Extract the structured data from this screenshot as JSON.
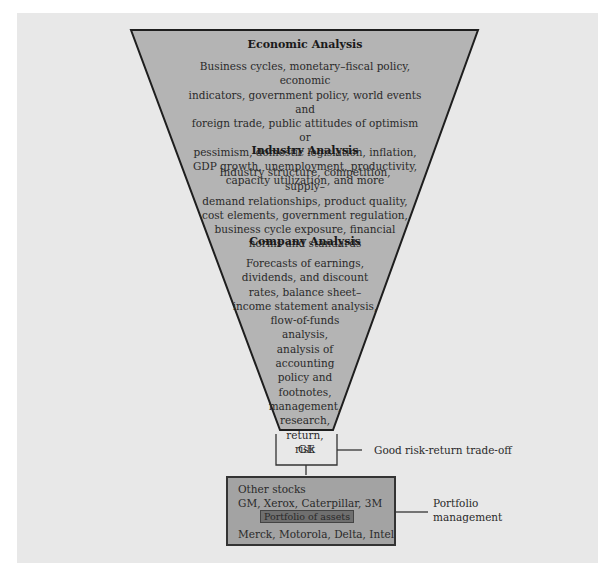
{
  "diagram": {
    "type": "funnel",
    "colors": {
      "background_panel": "#e8e8e8",
      "funnel_fill": "#b4b4b4",
      "portfolio_box_fill": "#a3a3a3",
      "assets_box_fill": "#6f6f6f",
      "stroke": "#1e1e1e"
    },
    "economic": {
      "title": "Economic Analysis",
      "lines": [
        "Business cycles, monetary–fiscal policy, economic",
        "indicators, government policy, world events and",
        "foreign trade, public attitudes of optimism or",
        "pessimism, domestic legislation, inflation,",
        "GDP growth, unemployment, productivity,",
        "capacity utilization, and more"
      ]
    },
    "industry": {
      "title": "Industry Analysis",
      "lines": [
        "Industry structure, competition, supply–",
        "demand relationships, product quality,",
        "cost elements, government regulation,",
        "business cycle exposure, financial",
        "norms and standards"
      ]
    },
    "company": {
      "title": "Company Analysis",
      "lines": [
        "Forecasts of earnings,",
        "dividends, and discount",
        "rates, balance sheet–",
        "income statement analysis,",
        "flow-of-funds",
        "analysis,",
        "analysis of",
        "accounting",
        "policy and",
        "footnotes,",
        "management,",
        "research,",
        "return,",
        "risk"
      ]
    },
    "selected_stock": {
      "label": "GE",
      "annotation": "Good risk-return trade-off"
    },
    "portfolio": {
      "heading": "Other stocks",
      "stocks_top": "GM, Xerox, Caterpillar, 3M",
      "assets_label": "Portfolio of assets",
      "stocks_bottom": "Merck, Motorola, Delta, Intel",
      "annotation_line1": "Portfolio",
      "annotation_line2": "management"
    }
  }
}
